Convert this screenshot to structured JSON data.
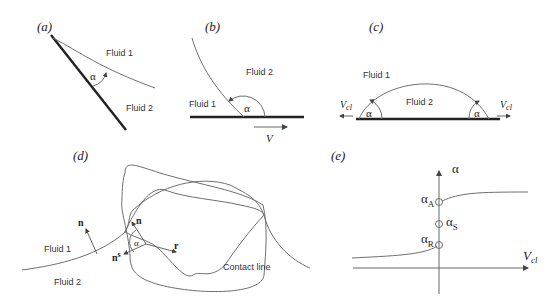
{
  "panels": {
    "a": {
      "label": "(a)",
      "fluid1": "Fluid 1",
      "fluid2": "Fluid 2",
      "angle": "α"
    },
    "b": {
      "label": "(b)",
      "fluid1": "Fluid 1",
      "fluid2": "Fluid 2",
      "angle": "α",
      "velocity": "V"
    },
    "c": {
      "label": "(c)",
      "fluid1": "Fluid 1",
      "fluid2": "Fluid 2",
      "angle_left": "α",
      "angle_right": "α",
      "vel_left": "V",
      "vel_left_sub": "cl",
      "vel_right": "V",
      "vel_right_sub": "cl"
    },
    "d": {
      "label": "(d)",
      "fluid1": "Fluid 1",
      "fluid2": "Fluid 2",
      "normal_outer": "n",
      "normal_inner": "n",
      "normal_solid": "n",
      "normal_solid_sup": "s",
      "radial": "r",
      "angle": "α",
      "contact_line": "Contact line"
    },
    "e": {
      "label": "(e)",
      "y_axis": "α",
      "x_axis": "V",
      "x_axis_sub": "cl",
      "points": [
        {
          "name": "α",
          "sub": "A"
        },
        {
          "name": "α",
          "sub": "S"
        },
        {
          "name": "α",
          "sub": "R"
        }
      ]
    }
  }
}
